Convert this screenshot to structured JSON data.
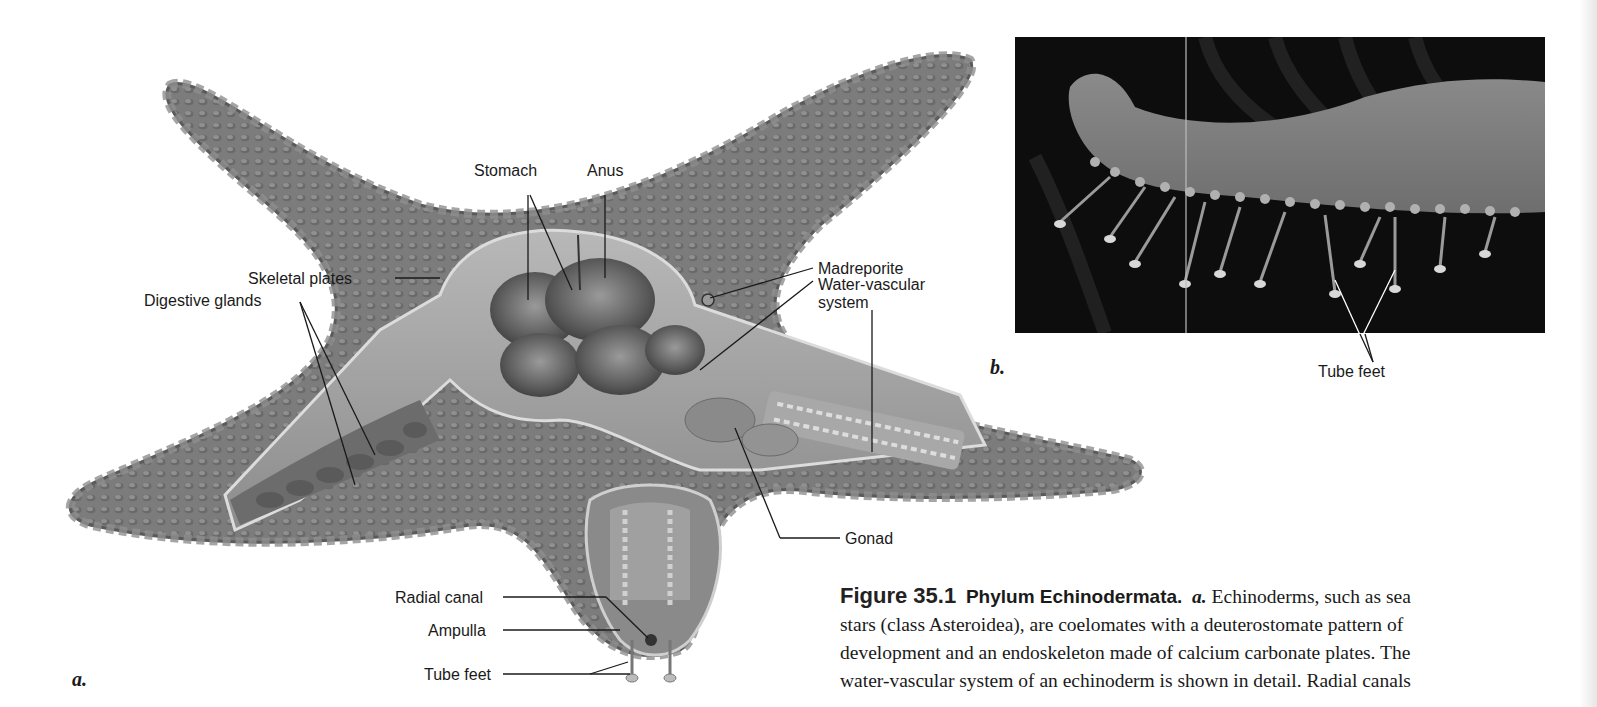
{
  "figure": {
    "number": "Figure 35.1",
    "title": "Phylum Echinodermata.",
    "panel_a_marker": "a.",
    "caption_lines": [
      "Echinoderms, such as sea",
      "stars (class Asteroidea), are coelomates with a deuterostomate pattern of",
      "development and an endoskeleton made of calcium carbonate plates. The",
      "water-vascular system of an echinoderm is shown in detail. Radial canals"
    ]
  },
  "panel_a": {
    "letter": "a.",
    "labels": {
      "stomach": "Stomach",
      "anus": "Anus",
      "madreporite": "Madreporite",
      "water_vascular_1": "Water-vascular",
      "water_vascular_2": "system",
      "skeletal_plates": "Skeletal plates",
      "digestive_glands": "Digestive glands",
      "gonad": "Gonad",
      "radial_canal": "Radial canal",
      "ampulla": "Ampulla",
      "tube_feet": "Tube feet"
    }
  },
  "panel_b": {
    "letter": "b.",
    "labels": {
      "tube_feet": "Tube feet"
    }
  },
  "colors": {
    "starfish_body": "#7a7a7a",
    "starfish_dark": "#4a4a4a",
    "photo_bg": "#0d0d0d",
    "text": "#1a1a1a"
  }
}
